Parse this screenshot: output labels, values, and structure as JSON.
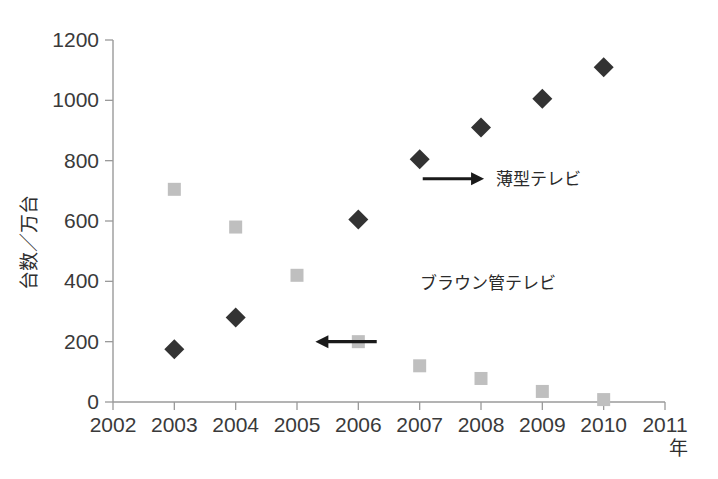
{
  "chart_data": {
    "type": "scatter",
    "title": "",
    "xlabel": "年",
    "ylabel": "台数／万台",
    "xlim": [
      2002,
      2011
    ],
    "ylim": [
      0,
      1200
    ],
    "grid": false,
    "legend_position": "inline-annotation",
    "x_ticks": [
      "2002",
      "2003",
      "2004",
      "2005",
      "2006",
      "2007",
      "2008",
      "2009",
      "2010",
      "2011"
    ],
    "y_ticks": [
      "0",
      "200",
      "400",
      "600",
      "800",
      "1000",
      "1200"
    ],
    "categories": [
      2003,
      2004,
      2005,
      2006,
      2007,
      2008,
      2009,
      2010
    ],
    "series": [
      {
        "name": "薄型テレビ",
        "marker": "diamond",
        "color": "#333333",
        "x": [
          2003,
          2004,
          2006,
          2007,
          2008,
          2009,
          2010
        ],
        "values": [
          175,
          280,
          605,
          805,
          910,
          1005,
          1110
        ]
      },
      {
        "name": "ブラウン管テレビ",
        "marker": "square",
        "color": "#bfbfbf",
        "x": [
          2003,
          2004,
          2005,
          2006,
          2007,
          2008,
          2009,
          2010
        ],
        "values": [
          705,
          580,
          420,
          200,
          120,
          78,
          35,
          8
        ]
      }
    ],
    "annotations": [
      {
        "label": "薄型テレビ",
        "arrow_direction": "right",
        "arrow_from": [
          2007.05,
          740
        ],
        "arrow_to": [
          2008.05,
          740
        ],
        "text_x": 2008.25,
        "text_y": 740
      },
      {
        "label": "ブラウン管テレビ",
        "arrow_direction": "left",
        "arrow_from": [
          2006.3,
          200
        ],
        "arrow_to": [
          2005.3,
          200
        ],
        "text_x": 2007.0,
        "text_y": 395
      }
    ]
  },
  "axes": {
    "y_axis_label": "台数／万台",
    "x_axis_label": "年"
  },
  "colors": {
    "flat_panel_marker": "#333333",
    "crt_marker": "#bfbfbf",
    "axis": "#9a9a9a",
    "text": "#333333",
    "annotation_arrow": "#1a1a1a",
    "background": "#ffffff"
  }
}
